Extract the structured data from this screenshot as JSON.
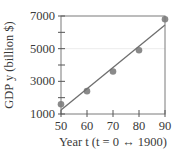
{
  "chart_data": {
    "type": "scatter",
    "title": "",
    "xlabel": "Year t (t = 0 ↔ 1900)",
    "ylabel": "GDP y (billion $)",
    "xlim": [
      50,
      90
    ],
    "ylim": [
      1000,
      7000
    ],
    "xticks": [
      50,
      60,
      70,
      80,
      90
    ],
    "yticks": [
      1000,
      3000,
      5000,
      7000
    ],
    "yminor_ticks": [
      2000,
      4000,
      6000
    ],
    "grid": false,
    "legend": null,
    "series": [
      {
        "name": "GDP data",
        "kind": "scatter",
        "x": [
          50,
          60,
          70,
          80,
          90
        ],
        "y": [
          1600,
          2400,
          3600,
          4900,
          6800
        ],
        "color": "#8a8a8a"
      },
      {
        "name": "Linear regression",
        "kind": "line",
        "x": [
          50,
          90
        ],
        "y": [
          1250,
          6450
        ],
        "color": "#6e6e6e"
      }
    ]
  },
  "labels": {
    "xlabel": "Year t (t = 0 ↔ 1900)",
    "ylabel": "GDP y (billion $)",
    "xticks": [
      "50",
      "60",
      "70",
      "80",
      "90"
    ],
    "yticks": [
      "1000",
      "3000",
      "5000",
      "7000"
    ]
  }
}
